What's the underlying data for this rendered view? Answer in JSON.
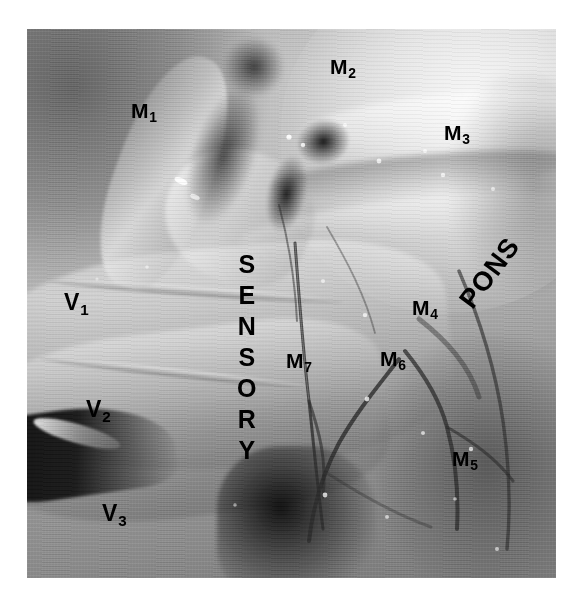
{
  "figure": {
    "kind": "anatomical-photograph",
    "background_color": "#ffffff",
    "photo": {
      "left": 27,
      "top": 29,
      "width": 529,
      "height": 549,
      "tone": "grayscale",
      "base_color": "#8d8d8d",
      "highlight_color": "#f2f2f2",
      "shadow_color": "#101010"
    }
  },
  "labels": {
    "motor_rootlets": [
      {
        "id": "M1",
        "letter": "M",
        "sub": "1",
        "x": 131,
        "y": 100
      },
      {
        "id": "M2",
        "letter": "M",
        "sub": "2",
        "x": 330,
        "y": 56
      },
      {
        "id": "M3",
        "letter": "M",
        "sub": "3",
        "x": 444,
        "y": 122
      },
      {
        "id": "M4",
        "letter": "M",
        "sub": "4",
        "x": 412,
        "y": 297
      },
      {
        "id": "M5",
        "letter": "M",
        "sub": "5",
        "x": 452,
        "y": 448
      },
      {
        "id": "M6",
        "letter": "M",
        "sub": "6",
        "x": 380,
        "y": 348
      },
      {
        "id": "M7",
        "letter": "M",
        "sub": "7",
        "x": 286,
        "y": 350
      }
    ],
    "sensory_divisions": [
      {
        "id": "V1",
        "letter": "V",
        "sub": "1",
        "x": 64,
        "y": 291
      },
      {
        "id": "V2",
        "letter": "V",
        "sub": "2",
        "x": 86,
        "y": 398
      },
      {
        "id": "V3",
        "letter": "V",
        "sub": "3",
        "x": 102,
        "y": 502
      }
    ],
    "sensory_root": {
      "text": "SENSORY",
      "letters": [
        "S",
        "E",
        "N",
        "S",
        "O",
        "R",
        "Y"
      ],
      "orientation": "vertical-stacked",
      "x": 222,
      "y_start": 220,
      "y_end": 438
    },
    "pons": {
      "text": "PONS",
      "orientation": "rotated",
      "rotation_deg": -53,
      "x": 463,
      "y": 244
    }
  },
  "style": {
    "label_color": "#000000",
    "label_font_weight": "bold",
    "m_label_size_px": 21,
    "v_label_size_px": 23,
    "sensory_size_px": 25,
    "pons_size_px": 27
  }
}
